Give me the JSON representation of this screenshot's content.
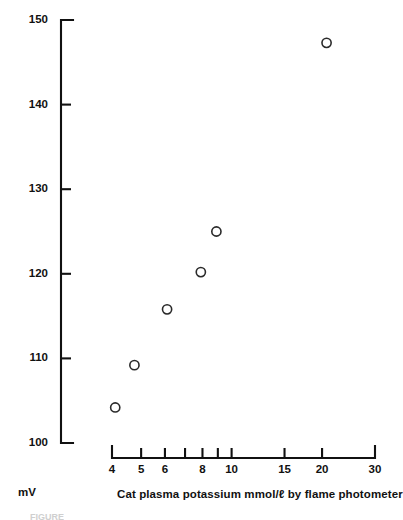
{
  "figure": {
    "y_axis_unit_label": "mV",
    "x_axis_caption": "Cat plasma potassium mmol/ℓ by flame photometer",
    "bottom_caption": "FIGURE"
  },
  "chart_data": {
    "type": "scatter",
    "title": "",
    "xlabel": "Cat plasma potassium mmol/ℓ by flame photometer",
    "ylabel": "mV",
    "xscale": "log",
    "yscale": "linear",
    "xlim": [
      4,
      30
    ],
    "ylim": [
      100,
      150
    ],
    "grid": false,
    "legend": null,
    "marker": "open-circle",
    "xticks": [
      4,
      5,
      6,
      7,
      8,
      9,
      10,
      15,
      20,
      30
    ],
    "xticklabels": [
      "4",
      "5",
      "6",
      "",
      "8",
      "",
      "10",
      "15",
      "20",
      "30"
    ],
    "yticks": [
      100,
      110,
      120,
      130,
      140,
      150
    ],
    "yticklabels": [
      "100",
      "110",
      "120",
      "130",
      "140",
      "150"
    ],
    "points": [
      {
        "x": 4.1,
        "y": 104.2
      },
      {
        "x": 4.75,
        "y": 109.2
      },
      {
        "x": 6.1,
        "y": 115.8
      },
      {
        "x": 7.9,
        "y": 120.2
      },
      {
        "x": 8.9,
        "y": 125.0
      },
      {
        "x": 20.7,
        "y": 147.3
      }
    ]
  },
  "colors": {
    "ink": "#111111",
    "marker_stroke": "#2a2a2a",
    "background": "#ffffff"
  }
}
